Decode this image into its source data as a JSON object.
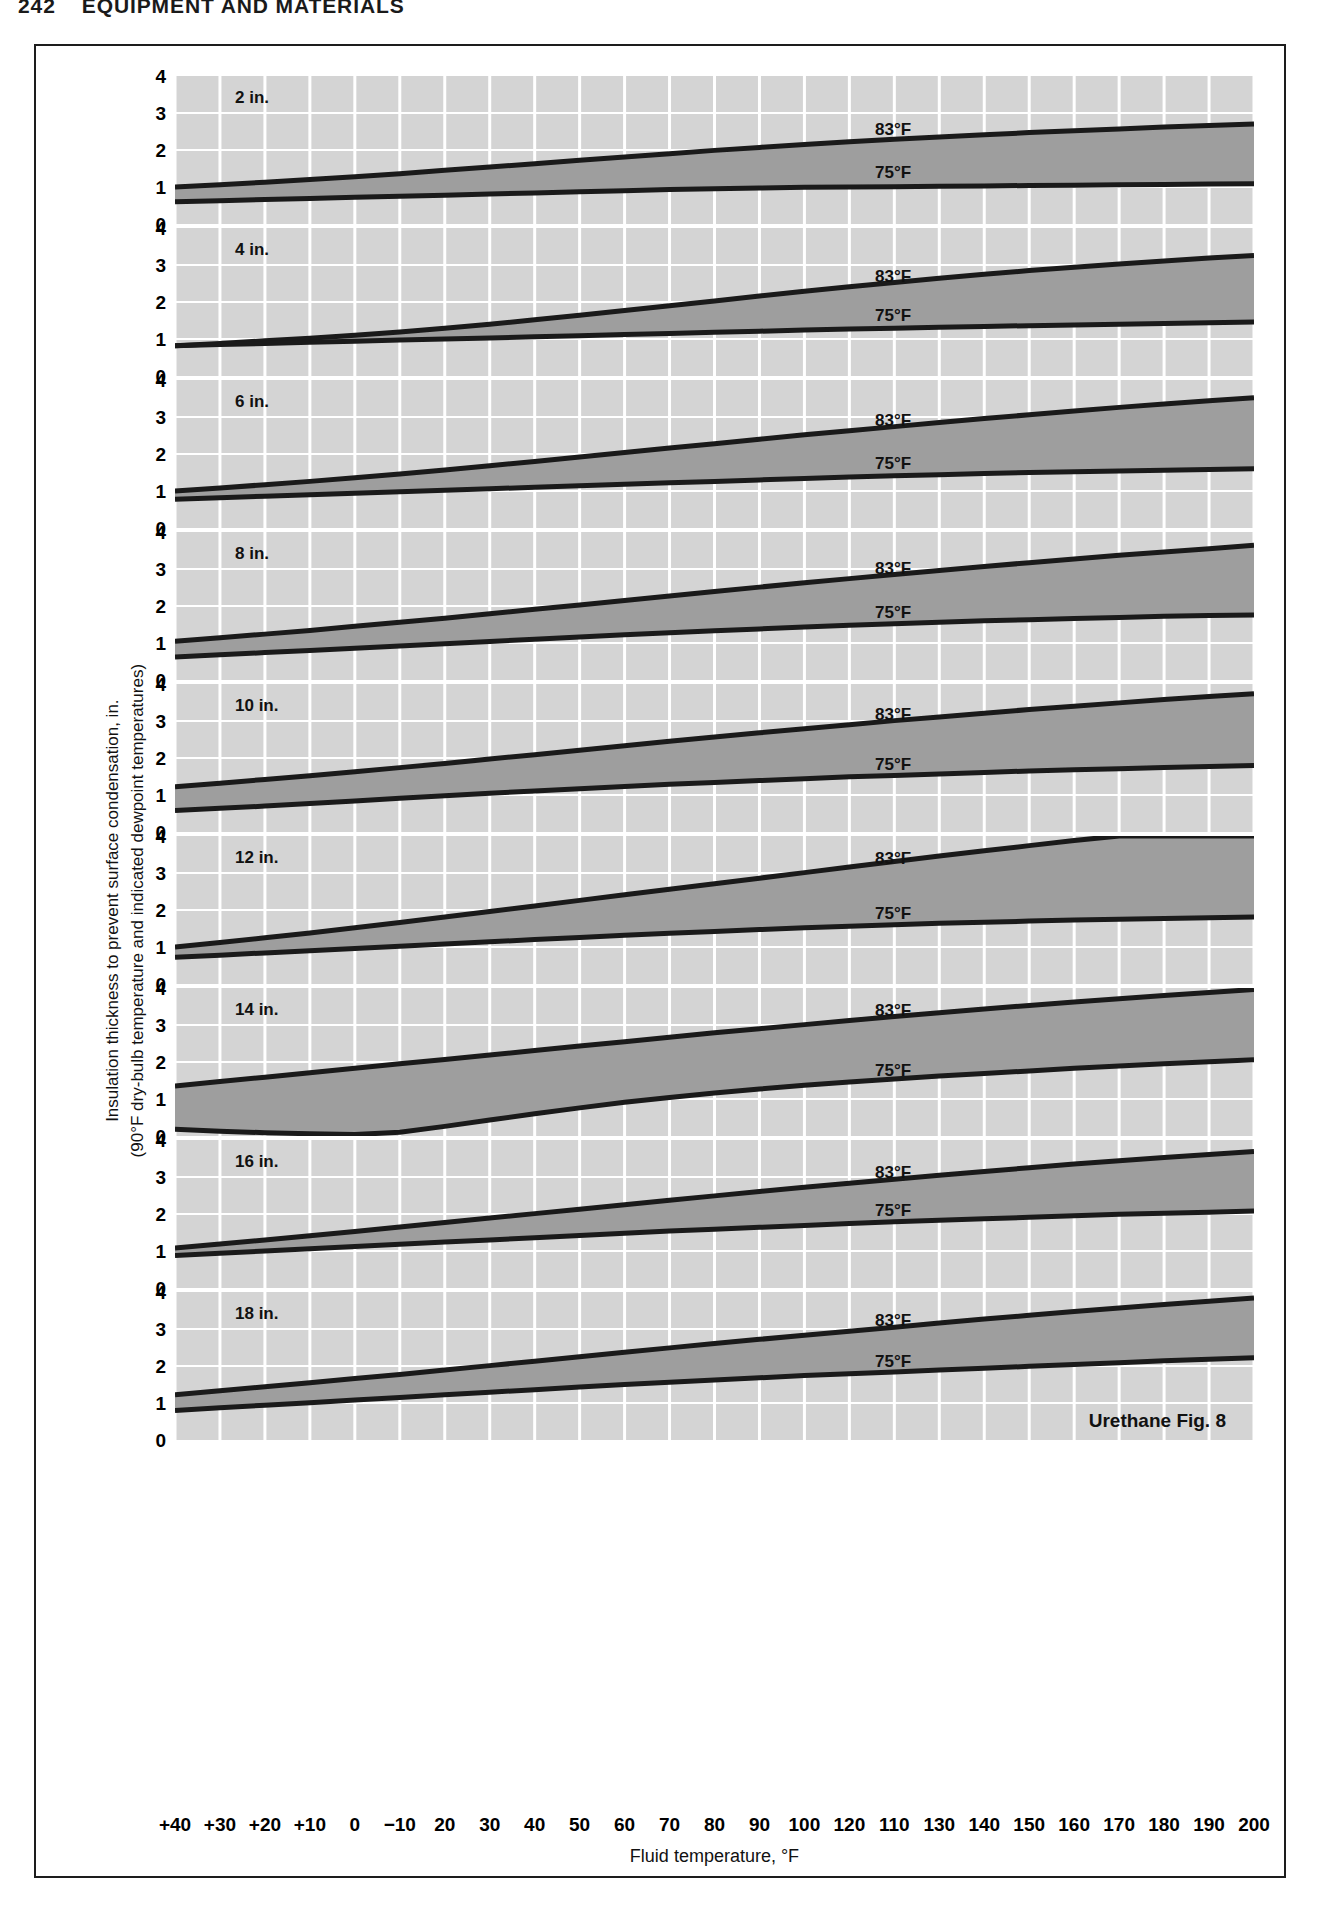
{
  "page": {
    "folio": "242",
    "running_head": "EQUIPMENT AND MATERIALS"
  },
  "axes": {
    "y_title_line1": "Insulation thickness to prevent surface condensation, in.",
    "y_title_line2": "(90°F dry-bulb temperature and indicated dewpoint temperatures)",
    "x_title": "Fluid temperature, °F",
    "y_ticks": [
      "4",
      "3",
      "2",
      "1",
      "0"
    ],
    "x_tick_labels": [
      "+40",
      "+30",
      "+20",
      "+10",
      "0",
      "−10",
      "20",
      "30",
      "40",
      "50",
      "60",
      "70",
      "80",
      "90",
      "100",
      "120",
      "110",
      "130",
      "140",
      "150",
      "160",
      "170",
      "180",
      "190",
      "200"
    ]
  },
  "figure": {
    "caption": "Urethane Fig. 8",
    "series_labels": {
      "upper": "83°F",
      "lower": "75°F"
    },
    "colors": {
      "panel_background": "#d4d4d4",
      "band_fill": "#9e9e9e",
      "gridline": "#ffffff",
      "curve": "#1a1a1a",
      "frame": "#1d1d1d"
    }
  },
  "chart_data": {
    "type": "line",
    "title": "Urethane Fig. 8",
    "xlabel": "Fluid temperature, °F",
    "ylabel": "Insulation thickness to prevent surface condensation, in.",
    "xlim": [
      0,
      24
    ],
    "ylim": [
      0,
      4
    ],
    "grid": true,
    "legend": [
      "83°F",
      "75°F"
    ],
    "x": [
      0,
      1,
      2,
      3,
      4,
      5,
      6,
      7,
      8,
      9,
      10,
      11,
      12,
      13,
      14,
      15,
      16,
      17,
      18,
      19,
      20,
      21,
      22,
      23,
      24
    ],
    "x_tick_labels": [
      "+40",
      "+30",
      "+20",
      "+10",
      "0",
      "−10",
      "20",
      "30",
      "40",
      "50",
      "60",
      "70",
      "80",
      "90",
      "100",
      "120",
      "110",
      "130",
      "140",
      "150",
      "160",
      "170",
      "180",
      "190",
      "200"
    ],
    "panels": [
      {
        "label": "2 in.",
        "series": [
          {
            "name": "83°F",
            "values": [
              1.0,
              1.06,
              1.13,
              1.2,
              1.28,
              1.36,
              1.45,
              1.54,
              1.63,
              1.72,
              1.81,
              1.9,
              1.99,
              2.07,
              2.15,
              2.22,
              2.29,
              2.35,
              2.41,
              2.47,
              2.52,
              2.57,
              2.62,
              2.66,
              2.7
            ]
          },
          {
            "name": "75°F",
            "values": [
              0.6,
              0.63,
              0.66,
              0.69,
              0.72,
              0.75,
              0.78,
              0.81,
              0.84,
              0.87,
              0.9,
              0.93,
              0.95,
              0.97,
              0.99,
              1.0,
              1.01,
              1.02,
              1.03,
              1.04,
              1.05,
              1.06,
              1.07,
              1.08,
              1.09
            ]
          }
        ]
      },
      {
        "label": "4 in.",
        "series": [
          {
            "name": "83°F",
            "values": [
              0.82,
              0.88,
              0.95,
              1.02,
              1.1,
              1.19,
              1.29,
              1.4,
              1.52,
              1.64,
              1.77,
              1.9,
              2.03,
              2.16,
              2.29,
              2.41,
              2.53,
              2.64,
              2.75,
              2.85,
              2.94,
              3.03,
              3.11,
              3.19,
              3.26
            ]
          },
          {
            "name": "75°F",
            "values": [
              0.82,
              0.85,
              0.88,
              0.91,
              0.94,
              0.97,
              1.0,
              1.03,
              1.06,
              1.09,
              1.12,
              1.15,
              1.18,
              1.21,
              1.24,
              1.27,
              1.29,
              1.32,
              1.34,
              1.36,
              1.38,
              1.4,
              1.42,
              1.44,
              1.46
            ]
          }
        ]
      },
      {
        "label": "6 in.",
        "series": [
          {
            "name": "83°F",
            "values": [
              1.0,
              1.08,
              1.17,
              1.26,
              1.36,
              1.46,
              1.57,
              1.68,
              1.8,
              1.92,
              2.04,
              2.16,
              2.28,
              2.4,
              2.52,
              2.63,
              2.74,
              2.85,
              2.96,
              3.06,
              3.16,
              3.26,
              3.35,
              3.44,
              3.52
            ]
          },
          {
            "name": "75°F",
            "values": [
              0.78,
              0.82,
              0.86,
              0.9,
              0.94,
              0.98,
              1.02,
              1.06,
              1.1,
              1.14,
              1.18,
              1.22,
              1.26,
              1.3,
              1.34,
              1.38,
              1.41,
              1.44,
              1.47,
              1.5,
              1.52,
              1.54,
              1.56,
              1.58,
              1.6
            ]
          }
        ]
      },
      {
        "label": "8 in.",
        "series": [
          {
            "name": "83°F",
            "values": [
              1.05,
              1.14,
              1.24,
              1.34,
              1.45,
              1.56,
              1.67,
              1.79,
              1.91,
              2.03,
              2.15,
              2.27,
              2.39,
              2.51,
              2.63,
              2.74,
              2.85,
              2.96,
              3.07,
              3.17,
              3.27,
              3.37,
              3.46,
              3.55,
              3.64
            ]
          },
          {
            "name": "75°F",
            "values": [
              0.62,
              0.68,
              0.74,
              0.8,
              0.86,
              0.92,
              0.98,
              1.04,
              1.1,
              1.16,
              1.22,
              1.28,
              1.33,
              1.38,
              1.43,
              1.48,
              1.52,
              1.56,
              1.6,
              1.63,
              1.66,
              1.69,
              1.72,
              1.74,
              1.76
            ]
          }
        ]
      },
      {
        "label": "10 in.",
        "series": [
          {
            "name": "83°F",
            "values": [
              1.22,
              1.32,
              1.42,
              1.52,
              1.63,
              1.74,
              1.85,
              1.97,
              2.09,
              2.21,
              2.33,
              2.45,
              2.57,
              2.68,
              2.79,
              2.9,
              3.01,
              3.11,
              3.21,
              3.31,
              3.4,
              3.49,
              3.58,
              3.66,
              3.74
            ]
          },
          {
            "name": "75°F",
            "values": [
              0.58,
              0.64,
              0.7,
              0.77,
              0.84,
              0.91,
              0.98,
              1.05,
              1.11,
              1.17,
              1.23,
              1.29,
              1.34,
              1.39,
              1.44,
              1.49,
              1.53,
              1.57,
              1.61,
              1.65,
              1.68,
              1.71,
              1.74,
              1.77,
              1.8
            ]
          }
        ]
      },
      {
        "label": "12 in.",
        "series": [
          {
            "name": "83°F",
            "values": [
              1.0,
              1.12,
              1.25,
              1.38,
              1.52,
              1.66,
              1.81,
              1.96,
              2.11,
              2.26,
              2.41,
              2.56,
              2.71,
              2.86,
              3.01,
              3.16,
              3.31,
              3.46,
              3.6,
              3.74,
              3.88,
              4.0,
              4.0,
              4.0,
              4.0
            ]
          },
          {
            "name": "75°F",
            "values": [
              0.72,
              0.78,
              0.84,
              0.9,
              0.96,
              1.02,
              1.08,
              1.14,
              1.2,
              1.26,
              1.32,
              1.37,
              1.42,
              1.47,
              1.52,
              1.56,
              1.6,
              1.64,
              1.67,
              1.7,
              1.73,
              1.75,
              1.77,
              1.79,
              1.81
            ]
          }
        ]
      },
      {
        "label": "14 in.",
        "series": [
          {
            "name": "83°F",
            "values": [
              1.35,
              1.47,
              1.59,
              1.71,
              1.83,
              1.95,
              2.07,
              2.19,
              2.31,
              2.43,
              2.55,
              2.67,
              2.79,
              2.9,
              3.01,
              3.12,
              3.23,
              3.33,
              3.43,
              3.53,
              3.62,
              3.71,
              3.8,
              3.88,
              3.96
            ]
          },
          {
            "name": "75°F",
            "values": [
              0.18,
              0.13,
              0.09,
              0.06,
              0.04,
              0.1,
              0.26,
              0.43,
              0.6,
              0.76,
              0.91,
              1.04,
              1.16,
              1.27,
              1.37,
              1.46,
              1.54,
              1.62,
              1.69,
              1.76,
              1.83,
              1.89,
              1.95,
              2.01,
              2.06
            ]
          }
        ]
      },
      {
        "label": "16 in.",
        "series": [
          {
            "name": "83°F",
            "values": [
              1.08,
              1.19,
              1.3,
              1.41,
              1.53,
              1.65,
              1.77,
              1.89,
              2.01,
              2.13,
              2.25,
              2.37,
              2.49,
              2.61,
              2.72,
              2.83,
              2.94,
              3.05,
              3.15,
              3.25,
              3.35,
              3.44,
              3.53,
              3.61,
              3.69
            ]
          },
          {
            "name": "75°F",
            "values": [
              0.88,
              0.94,
              1.0,
              1.06,
              1.12,
              1.18,
              1.24,
              1.3,
              1.36,
              1.42,
              1.48,
              1.54,
              1.59,
              1.64,
              1.69,
              1.74,
              1.79,
              1.83,
              1.87,
              1.91,
              1.95,
              1.99,
              2.02,
              2.05,
              2.08
            ]
          }
        ]
      },
      {
        "label": "18 in.",
        "series": [
          {
            "name": "83°F",
            "values": [
              1.22,
              1.33,
              1.44,
              1.55,
              1.66,
              1.77,
              1.89,
              2.01,
              2.13,
              2.25,
              2.37,
              2.49,
              2.61,
              2.72,
              2.83,
              2.94,
              3.05,
              3.16,
              3.27,
              3.37,
              3.47,
              3.57,
              3.66,
              3.75,
              3.84
            ]
          },
          {
            "name": "75°F",
            "values": [
              0.8,
              0.87,
              0.94,
              1.01,
              1.08,
              1.15,
              1.22,
              1.29,
              1.36,
              1.43,
              1.5,
              1.56,
              1.62,
              1.68,
              1.74,
              1.79,
              1.84,
              1.89,
              1.94,
              1.99,
              2.04,
              2.09,
              2.14,
              2.18,
              2.22
            ]
          }
        ]
      }
    ]
  }
}
